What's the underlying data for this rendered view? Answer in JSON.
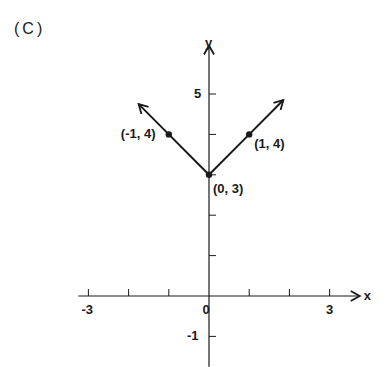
{
  "panel_label": "(C)",
  "chart_data": {
    "type": "line",
    "title": "",
    "function": "y = |x| + 3",
    "xlabel": "x",
    "ylabel": "y",
    "xlim": [
      -3.2,
      3.7
    ],
    "ylim": [
      -1.7,
      6.2
    ],
    "grid": false,
    "x_ticks": [
      -3,
      -2,
      -1,
      0,
      1,
      2,
      3
    ],
    "x_tick_labels": [
      {
        "value": -3,
        "label": "-3"
      },
      {
        "value": 0,
        "label": "0"
      },
      {
        "value": 3,
        "label": "3"
      }
    ],
    "y_ticks": [
      -1,
      1,
      2,
      3,
      4,
      5
    ],
    "y_tick_labels": [
      {
        "value": 5,
        "label": "5"
      },
      {
        "value": -1,
        "label": "-1"
      }
    ],
    "series": [
      {
        "name": "y = |x| + 3",
        "x": [
          -1.75,
          -1,
          0,
          1,
          1.85
        ],
        "y": [
          4.75,
          4,
          3,
          4,
          4.85
        ],
        "arrows_at_ends": true
      }
    ],
    "points": [
      {
        "x": -1,
        "y": 4,
        "label": "(-1, 4)"
      },
      {
        "x": 0,
        "y": 3,
        "label": "(0, 3)"
      },
      {
        "x": 1,
        "y": 4,
        "label": "(1, 4)"
      }
    ],
    "line_color": "#1a1a1a"
  }
}
